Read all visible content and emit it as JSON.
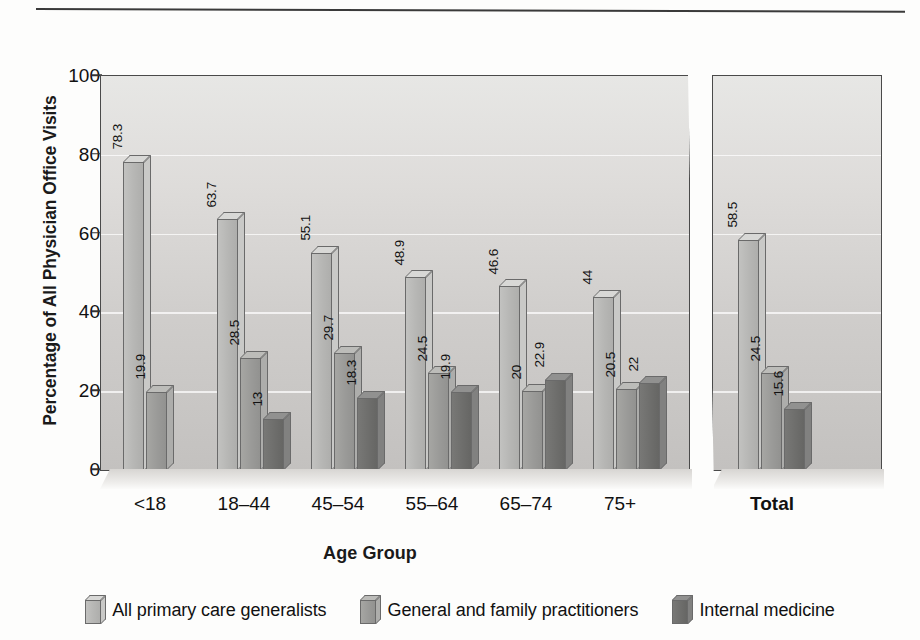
{
  "chart_data": {
    "type": "bar",
    "title": "",
    "xlabel": "Age Group",
    "ylabel": "Percentage of All Physician Office Visits",
    "ylim": [
      0,
      100
    ],
    "yticks": [
      0,
      20,
      40,
      60,
      80,
      100
    ],
    "grid": true,
    "legend_position": "bottom",
    "categories": [
      "<18",
      "18–44",
      "45–54",
      "55–64",
      "65–74",
      "75+",
      "Total"
    ],
    "series": [
      {
        "name": "All primary care generalists",
        "color": "#b6b6b4",
        "values": [
          78.3,
          63.7,
          55.1,
          48.9,
          46.6,
          44,
          58.5
        ],
        "labels": [
          "78.3",
          "63.7",
          "55.1",
          "48.9",
          "46.6",
          "44",
          "58.5"
        ]
      },
      {
        "name": "General and family practitioners",
        "color": "#9a9a98",
        "values": [
          19.9,
          28.5,
          29.7,
          24.5,
          20,
          20.5,
          24.5
        ],
        "labels": [
          "19.9",
          "28.5",
          "29.7",
          "24.5",
          "20",
          "20.5",
          "24.5"
        ]
      },
      {
        "name": "Internal medicine",
        "color": "#6e6e6c",
        "values": [
          null,
          13,
          18.3,
          19.9,
          22.9,
          22,
          15.6
        ],
        "labels": [
          "",
          "13",
          "18.3",
          "19.9",
          "22.9",
          "22",
          "15.6"
        ]
      }
    ],
    "annotations": [
      "Axis break between 75+ group and Total panel"
    ]
  },
  "axis": {
    "y_title": "Percentage of All Physician Office Visits",
    "x_title": "Age Group",
    "y_ticks": [
      "100",
      "80",
      "60",
      "40",
      "20",
      "0"
    ]
  },
  "groups": [
    {
      "label": "<18",
      "bold": false
    },
    {
      "label": "18–44",
      "bold": false
    },
    {
      "label": "45–54",
      "bold": false
    },
    {
      "label": "55–64",
      "bold": false
    },
    {
      "label": "65–74",
      "bold": false
    },
    {
      "label": "75+",
      "bold": false
    },
    {
      "label": "Total",
      "bold": true
    }
  ],
  "legend": {
    "items": [
      {
        "label": "All primary care generalists",
        "series": "s0"
      },
      {
        "label": "General and family practitioners",
        "series": "s1"
      },
      {
        "label": "Internal medicine",
        "series": "s2"
      }
    ]
  }
}
